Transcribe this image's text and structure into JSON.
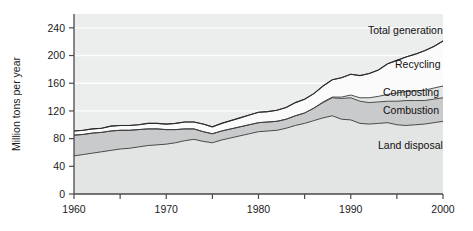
{
  "chart_data": {
    "type": "area",
    "stacked": true,
    "title": "",
    "xlabel": "",
    "ylabel": "Million tons per year",
    "xlim": [
      1960,
      2000
    ],
    "ylim": [
      0,
      260
    ],
    "grid": true,
    "grid_color": "#ffffff",
    "plot_background": "#eceded",
    "legend_position": "inline-right",
    "yticks": [
      0,
      40,
      80,
      120,
      160,
      200,
      240
    ],
    "ytick_labels": [
      "0",
      "40",
      "80",
      "120",
      "160",
      "200",
      "240"
    ],
    "xticks": [
      1960,
      1965,
      1970,
      1975,
      1980,
      1985,
      1990,
      1995,
      2000
    ],
    "xtick_labels": [
      "1960",
      "",
      "1970",
      "",
      "1980",
      "",
      "1990",
      "",
      "2000"
    ],
    "x": [
      1960,
      1961,
      1962,
      1963,
      1964,
      1965,
      1966,
      1967,
      1968,
      1969,
      1970,
      1971,
      1972,
      1973,
      1974,
      1975,
      1976,
      1977,
      1978,
      1979,
      1980,
      1981,
      1982,
      1983,
      1984,
      1985,
      1986,
      1987,
      1988,
      1989,
      1990,
      1991,
      1992,
      1993,
      1994,
      1995,
      1996,
      1997,
      1998,
      1999,
      2000
    ],
    "series": [
      {
        "name": "Land disposal",
        "fill": "#e3e4e4",
        "values": [
          55,
          57,
          59,
          61,
          63,
          65,
          66,
          68,
          70,
          71,
          72,
          74,
          77,
          79,
          76,
          74,
          78,
          81,
          84,
          87,
          90,
          91,
          92,
          95,
          99,
          102,
          106,
          110,
          113,
          108,
          107,
          102,
          101,
          102,
          103,
          100,
          99,
          100,
          101,
          103,
          105
        ]
      },
      {
        "name": "Combustion",
        "fill": "#c9cacb",
        "values": [
          30,
          29,
          29,
          28,
          28,
          27,
          26,
          25,
          24,
          23,
          21,
          19,
          17,
          15,
          14,
          13,
          13,
          13,
          13,
          13,
          13,
          13,
          13,
          13,
          14,
          15,
          18,
          22,
          26,
          30,
          32,
          32,
          31,
          31,
          31,
          34,
          36,
          35,
          34,
          34,
          34
        ]
      },
      {
        "name": "Composting",
        "fill": "#e3e4e4",
        "values": [
          0,
          0,
          0,
          0,
          0,
          0,
          0,
          0,
          0,
          0,
          0,
          0,
          0,
          0,
          0,
          0,
          0,
          0,
          0,
          0,
          0,
          0,
          0,
          0,
          0,
          0,
          0,
          1,
          1,
          2,
          4,
          5,
          7,
          8,
          10,
          12,
          13,
          14,
          15,
          16,
          17
        ]
      },
      {
        "name": "Recycling",
        "fill": "#fbfbfb",
        "values": [
          6,
          6,
          6,
          6,
          7,
          7,
          7,
          7,
          8,
          8,
          8,
          9,
          10,
          10,
          11,
          10,
          11,
          12,
          13,
          14,
          15,
          15,
          16,
          17,
          19,
          20,
          21,
          23,
          25,
          28,
          30,
          32,
          35,
          38,
          44,
          47,
          50,
          53,
          57,
          60,
          65
        ]
      }
    ],
    "total_line": {
      "name": "Total generation",
      "values": [
        91,
        92,
        94,
        95,
        98,
        99,
        99,
        100,
        102,
        102,
        101,
        102,
        104,
        104,
        101,
        97,
        102,
        106,
        110,
        114,
        118,
        119,
        121,
        125,
        132,
        137,
        145,
        156,
        165,
        168,
        173,
        171,
        174,
        179,
        188,
        193,
        198,
        202,
        207,
        213,
        221
      ]
    },
    "annotations": [
      {
        "text": "Total generation",
        "x_px": 368,
        "y_px": 34
      },
      {
        "text": "Recycling",
        "x_px": 395,
        "y_px": 68
      },
      {
        "text": "Composting",
        "x_px": 383,
        "y_px": 96
      },
      {
        "text": "Combustion",
        "x_px": 383,
        "y_px": 114
      },
      {
        "text": "Land disposal",
        "x_px": 378,
        "y_px": 149
      }
    ]
  }
}
